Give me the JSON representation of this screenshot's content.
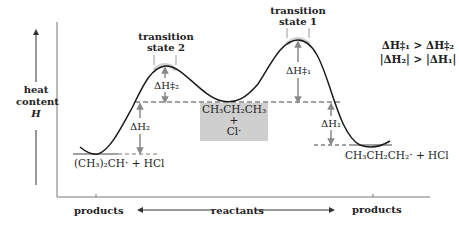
{
  "axis": {
    "y_label_line1": "heat",
    "y_label_line2": "content",
    "y_label_symbol": "H"
  },
  "x_axis": {
    "left_label": "products",
    "center_label": "reactants",
    "right_label": "products"
  },
  "transition_states": {
    "ts2_line1": "transition",
    "ts2_line2": "state 2",
    "ts1_line1": "transition",
    "ts1_line2": "state 1"
  },
  "energy_labels": {
    "dH2_act": "ΔH‡₂",
    "dH1_act": "ΔH‡₁",
    "dH2": "ΔH₂",
    "dH1": "ΔH₁"
  },
  "species": {
    "reactants_line1": "CH₃CH₂CH₃",
    "reactants_line2": "+",
    "reactants_line3": "Cl·",
    "left_products": "(CH₃)₂CH· + HCl",
    "right_products": "CH₃CH₂CH₂· + HCl"
  },
  "relations": {
    "line1": "ΔH‡₁ > ΔH‡₂",
    "line2": "|ΔH₂| > |ΔH₁|"
  },
  "colors": {
    "curve": "#1a1a1a",
    "arrow_grey": "#8a8a8a",
    "box_fill": "#cfcfcf",
    "peak_highlight": "#d9d9d9",
    "axis": "#555555"
  }
}
